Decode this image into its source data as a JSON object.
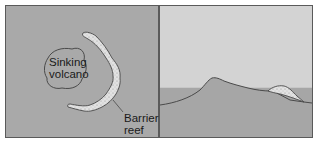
{
  "figure": {
    "left_panel": {
      "view": "top",
      "volcano_label": [
        "Sinking",
        "volcano"
      ],
      "reef_label": [
        "Barrier",
        "reef"
      ]
    },
    "right_panel": {
      "view": "cross-section"
    }
  },
  "colors": {
    "left_background": "#a9a9a9",
    "sky": "#d3d3d3",
    "water": "#a6a6a6",
    "reef_fill": "#dedede",
    "outline": "#555555"
  }
}
